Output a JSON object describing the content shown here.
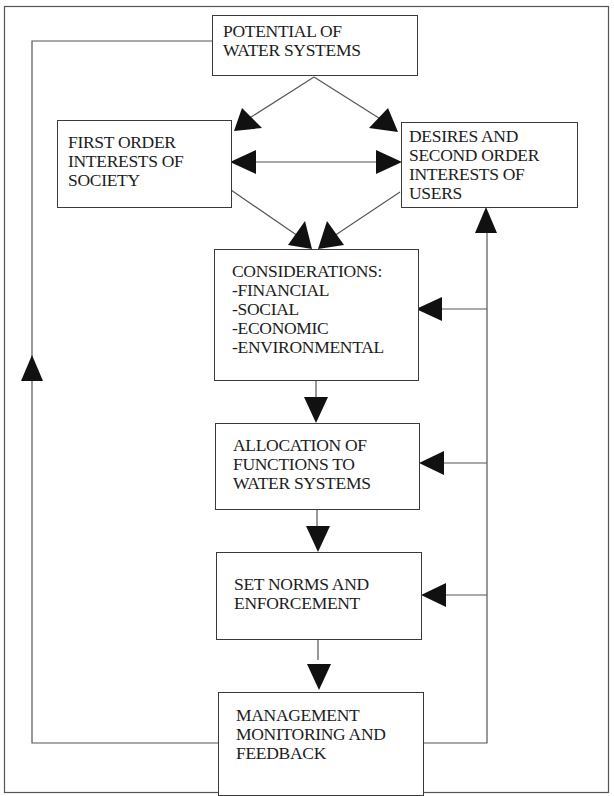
{
  "diagram": {
    "type": "flowchart",
    "line_color": "#555555",
    "arrow_color": "#111111",
    "boxes": {
      "potential": {
        "lines": [
          "POTENTIAL OF",
          "WATER SYSTEMS"
        ]
      },
      "first_order": {
        "lines": [
          "FIRST ORDER",
          "INTERESTS OF",
          "SOCIETY"
        ]
      },
      "desires": {
        "lines": [
          "DESIRES AND",
          "SECOND ORDER",
          "INTERESTS OF",
          "USERS"
        ]
      },
      "considerations": {
        "lines": [
          "CONSIDERATIONS:",
          "-FINANCIAL",
          "-SOCIAL",
          "-ECONOMIC",
          "-ENVIRONMENTAL"
        ]
      },
      "allocation": {
        "lines": [
          "ALLOCATION OF",
          "FUNCTIONS TO",
          "WATER SYSTEMS"
        ]
      },
      "norms": {
        "lines": [
          "SET NORMS AND",
          "ENFORCEMENT"
        ]
      },
      "management": {
        "lines": [
          "MANAGEMENT",
          "MONITORING AND",
          "FEEDBACK"
        ]
      }
    },
    "edges": [
      {
        "from": "potential",
        "to": "first_order"
      },
      {
        "from": "potential",
        "to": "desires"
      },
      {
        "from": "first_order",
        "to": "desires",
        "bidirectional": true
      },
      {
        "from": "first_order",
        "to": "considerations"
      },
      {
        "from": "desires",
        "to": "considerations"
      },
      {
        "from": "considerations",
        "to": "allocation"
      },
      {
        "from": "allocation",
        "to": "norms"
      },
      {
        "from": "norms",
        "to": "management"
      },
      {
        "from": "management",
        "to": "potential",
        "route": "left feedback loop"
      },
      {
        "from": "management",
        "to": "desires",
        "route": "right feedback loop"
      },
      {
        "from": "management",
        "to": "considerations",
        "route": "right feedback loop"
      },
      {
        "from": "management",
        "to": "allocation",
        "route": "right feedback loop"
      },
      {
        "from": "management",
        "to": "norms",
        "route": "right feedback loop"
      }
    ]
  }
}
